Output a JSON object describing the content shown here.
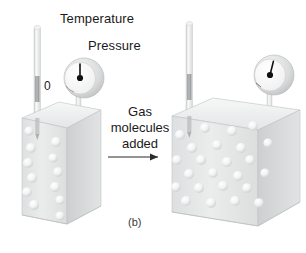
{
  "figure": {
    "caption": "(b)",
    "labels": {
      "temperature": "Temperature",
      "pressure": "Pressure",
      "gauge_zero": "0",
      "center_text": "Gas\nmolecules\nadded"
    },
    "colors": {
      "background": "#ffffff",
      "text": "#1a1a1a",
      "box_front": "#e8e9ea",
      "box_side": "#d3d5d6",
      "box_top": "#f1f2f2",
      "box_edge": "#b8babb",
      "sphere": "#f4f5f5",
      "sphere_shadow": "#c9cbcc",
      "gauge_rim": "#cfd1d2",
      "gauge_face": "#fbfbfb",
      "needle": "#111111",
      "tube_glass": "#e6e7e8",
      "tube_fluid": "#9a9c9e",
      "arrow": "#2b2b2b"
    },
    "arrow": {
      "direction": "right",
      "label": "process-arrow"
    },
    "panels": [
      {
        "id": "before",
        "name": "container-before",
        "molecule_count": 12,
        "gauge": {
          "needle_angle_deg": 0,
          "reading_label": "0"
        },
        "thermometer": {
          "fluid_level": "low"
        },
        "molecules": [
          {
            "x": 18,
            "y": 56
          },
          {
            "x": 52,
            "y": 48
          },
          {
            "x": 10,
            "y": 76
          },
          {
            "x": 44,
            "y": 70
          },
          {
            "x": 20,
            "y": 96
          },
          {
            "x": 55,
            "y": 90
          },
          {
            "x": 9,
            "y": 116
          },
          {
            "x": 46,
            "y": 110
          },
          {
            "x": 24,
            "y": 134
          },
          {
            "x": 58,
            "y": 128
          },
          {
            "x": 14,
            "y": 154
          },
          {
            "x": 50,
            "y": 150
          }
        ]
      },
      {
        "id": "after",
        "name": "container-after",
        "molecule_count": 24,
        "gauge": {
          "needle_angle_deg": 14,
          "reading_label": ""
        },
        "thermometer": {
          "fluid_level": "low"
        },
        "molecules": [
          {
            "x": 12,
            "y": 42
          },
          {
            "x": 46,
            "y": 36
          },
          {
            "x": 82,
            "y": 38
          },
          {
            "x": 112,
            "y": 34
          },
          {
            "x": 28,
            "y": 60
          },
          {
            "x": 62,
            "y": 58
          },
          {
            "x": 96,
            "y": 56
          },
          {
            "x": 120,
            "y": 62
          },
          {
            "x": 10,
            "y": 78
          },
          {
            "x": 44,
            "y": 76
          },
          {
            "x": 78,
            "y": 80
          },
          {
            "x": 108,
            "y": 78
          },
          {
            "x": 26,
            "y": 98
          },
          {
            "x": 58,
            "y": 96
          },
          {
            "x": 90,
            "y": 100
          },
          {
            "x": 118,
            "y": 96
          },
          {
            "x": 9,
            "y": 116
          },
          {
            "x": 42,
            "y": 118
          },
          {
            "x": 74,
            "y": 114
          },
          {
            "x": 104,
            "y": 118
          },
          {
            "x": 24,
            "y": 138
          },
          {
            "x": 56,
            "y": 142
          },
          {
            "x": 88,
            "y": 138
          },
          {
            "x": 116,
            "y": 140
          }
        ]
      }
    ]
  }
}
